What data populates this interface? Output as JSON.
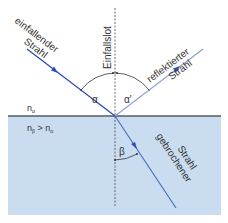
{
  "diagram": {
    "labels": {
      "incident_line1": "einfallender",
      "incident_line2": "Strahl",
      "normal": "Einfallslot",
      "reflected_line1": "reflektierter",
      "reflected_line2": "Strahl",
      "refracted_line1": "gebrochener",
      "refracted_line2": "Strahl",
      "angle_incidence": "α",
      "angle_reflection": "α'",
      "angle_refraction": "β",
      "medium_top": "nα",
      "medium_top_base": "n",
      "medium_top_sub": "α",
      "medium_bottom_base": "n",
      "medium_bottom_sub": "β",
      "medium_bottom_rel": " > n",
      "medium_bottom_rel_sub": "α"
    },
    "colors": {
      "ray_incident": "#2b4fb8",
      "ray_reflected": "#8aa0d8",
      "ray_refracted": "#4a68c0",
      "interface": "#555b66",
      "medium_fill": "#c9dcf0",
      "text": "#333333",
      "normal": "#444444"
    }
  }
}
